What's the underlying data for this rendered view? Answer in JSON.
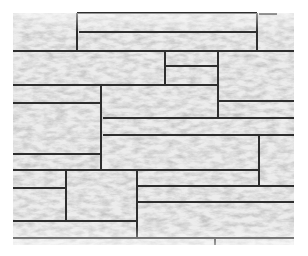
{
  "image": {
    "subject": "Stone wall cladding texture",
    "description": "Light grey split-face stone panels in a random ashlar pattern with dark grout lines",
    "colors": {
      "background": "#ffffff",
      "stone_light": "#ececec",
      "stone_mid": "#d9d9d9",
      "stone_dark": "#b8b8b8",
      "grout": "#2e2e2e"
    },
    "wall_bounds": {
      "x": 13,
      "y": 13,
      "width": 281,
      "height": 232
    },
    "grout_horizontal": [
      {
        "y": 13,
        "x1": 77,
        "x2": 257
      },
      {
        "y": 14,
        "x1": 259,
        "x2": 277
      },
      {
        "y": 32,
        "x1": 79,
        "x2": 257
      },
      {
        "y": 51,
        "x1": 13,
        "x2": 294
      },
      {
        "y": 66,
        "x1": 165,
        "x2": 218
      },
      {
        "y": 85,
        "x1": 13,
        "x2": 218
      },
      {
        "y": 101,
        "x1": 218,
        "x2": 294
      },
      {
        "y": 103,
        "x1": 13,
        "x2": 101
      },
      {
        "y": 118,
        "x1": 103,
        "x2": 294
      },
      {
        "y": 135,
        "x1": 103,
        "x2": 294
      },
      {
        "y": 154,
        "x1": 13,
        "x2": 101
      },
      {
        "y": 170,
        "x1": 13,
        "x2": 259
      },
      {
        "y": 186,
        "x1": 137,
        "x2": 294
      },
      {
        "y": 188,
        "x1": 13,
        "x2": 66
      },
      {
        "y": 202,
        "x1": 137,
        "x2": 294
      },
      {
        "y": 221,
        "x1": 13,
        "x2": 137
      },
      {
        "y": 238,
        "x1": 13,
        "x2": 294
      }
    ],
    "grout_vertical": [
      {
        "x": 77,
        "y1": 13,
        "y2": 51
      },
      {
        "x": 257,
        "y1": 13,
        "y2": 51
      },
      {
        "x": 165,
        "y1": 51,
        "y2": 85
      },
      {
        "x": 218,
        "y1": 51,
        "y2": 118
      },
      {
        "x": 101,
        "y1": 85,
        "y2": 171
      },
      {
        "x": 259,
        "y1": 135,
        "y2": 186
      },
      {
        "x": 66,
        "y1": 170,
        "y2": 221
      },
      {
        "x": 137,
        "y1": 170,
        "y2": 238
      },
      {
        "x": 215,
        "y1": 238,
        "y2": 245
      }
    ]
  }
}
